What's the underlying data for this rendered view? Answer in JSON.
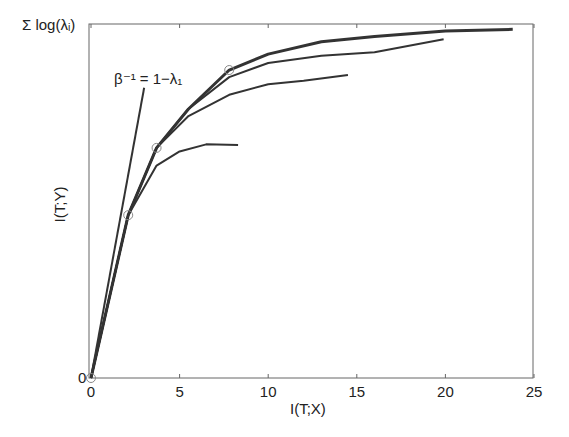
{
  "chart_data": {
    "type": "line",
    "title": "",
    "xlabel": "I(T;X)",
    "ylabel": "I(T;Y)",
    "xlim": [
      0,
      25
    ],
    "ylim": [
      0,
      1
    ],
    "x_ticks": [
      "0",
      "5",
      "10",
      "15",
      "20",
      "25"
    ],
    "y_ticks": [
      "0",
      "Σ log(λᵢ)"
    ],
    "y_tick_note": "y axis normalized: 0 at bottom, 1 = Σ log(λi) at top",
    "grid": false,
    "legend": null,
    "annotation": "β⁻¹ = 1−λ₁",
    "series": [
      {
        "name": "optimal information curve (envelope)",
        "x": [
          0,
          2.1,
          3.7,
          5.5,
          7.8,
          10,
          13,
          16,
          20,
          23.8
        ],
        "y": [
          0,
          0.46,
          0.65,
          0.76,
          0.87,
          0.915,
          0.95,
          0.965,
          0.98,
          0.985
        ]
      },
      {
        "name": "curve ending at x≈19.9",
        "x": [
          0,
          2.1,
          3.7,
          5.5,
          7.8,
          10,
          13,
          16,
          19.9
        ],
        "y": [
          0,
          0.46,
          0.65,
          0.76,
          0.85,
          0.89,
          0.91,
          0.92,
          0.957
        ]
      },
      {
        "name": "curve ending at x≈14.5",
        "x": [
          0,
          2.1,
          3.7,
          5.5,
          7.8,
          10,
          12,
          14.5
        ],
        "y": [
          0,
          0.46,
          0.65,
          0.74,
          0.8,
          0.83,
          0.84,
          0.856
        ]
      },
      {
        "name": "curve ending at x≈8.3",
        "x": [
          0,
          2.1,
          3.7,
          5,
          6.5,
          8.3
        ],
        "y": [
          0,
          0.46,
          0.6,
          0.64,
          0.66,
          0.658
        ]
      },
      {
        "name": "tangent line β⁻¹ = 1−λ₁",
        "x": [
          0,
          3.0
        ],
        "y": [
          0,
          0.82
        ]
      }
    ],
    "markers": {
      "shape": "circle",
      "x": [
        0,
        2.1,
        3.7,
        7.8
      ],
      "y": [
        0,
        0.46,
        0.65,
        0.87
      ]
    }
  }
}
